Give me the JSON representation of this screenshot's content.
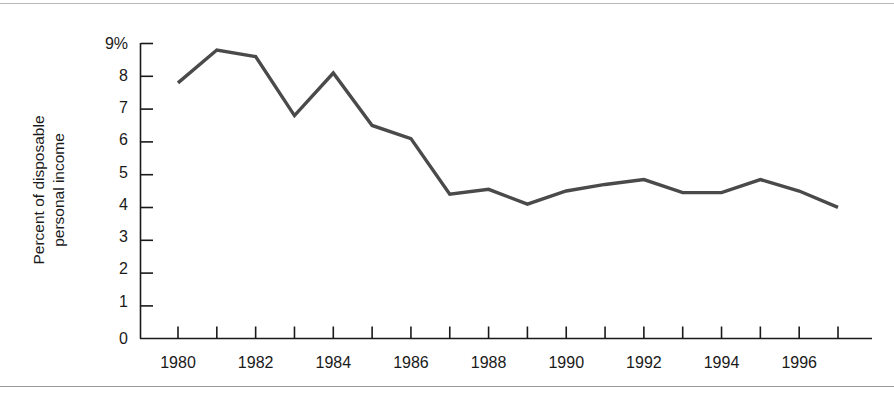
{
  "chart_data": {
    "type": "line",
    "title": "",
    "subtitle": "",
    "xlabel": "",
    "ylabel": "Percent of disposable personal income",
    "ylabel_lines": [
      "Percent of disposable",
      "personal income"
    ],
    "x": [
      1980,
      1981,
      1982,
      1983,
      1984,
      1985,
      1986,
      1987,
      1988,
      1989,
      1990,
      1991,
      1992,
      1993,
      1994,
      1995,
      1996,
      1997
    ],
    "values": [
      7.8,
      8.8,
      8.6,
      6.8,
      8.1,
      6.5,
      6.1,
      4.4,
      4.55,
      4.1,
      4.5,
      4.7,
      4.85,
      4.45,
      4.45,
      4.85,
      4.5,
      4.0
    ],
    "series": [
      {
        "name": "Personal saving rate",
        "values": [
          7.8,
          8.8,
          8.6,
          6.8,
          8.1,
          6.5,
          6.1,
          4.4,
          4.55,
          4.1,
          4.5,
          4.7,
          4.85,
          4.45,
          4.45,
          4.85,
          4.5,
          4.0
        ]
      }
    ],
    "xlim": [
      1980,
      1997
    ],
    "ylim": [
      0,
      9
    ],
    "ytick_values": [
      0,
      1,
      2,
      3,
      4,
      5,
      6,
      7,
      8,
      9
    ],
    "ytick_labels": [
      "0",
      "1",
      "2",
      "3",
      "4",
      "5",
      "6",
      "7",
      "8",
      "9%"
    ],
    "xtick_values": [
      1980,
      1981,
      1982,
      1983,
      1984,
      1985,
      1986,
      1987,
      1988,
      1989,
      1990,
      1991,
      1992,
      1993,
      1994,
      1995,
      1996,
      1997
    ],
    "xtick_labels_shown": [
      "1980",
      "1982",
      "1984",
      "1986",
      "1988",
      "1990",
      "1992",
      "1994",
      "1996"
    ],
    "xtick_labeled_values": [
      1980,
      1982,
      1984,
      1986,
      1988,
      1990,
      1992,
      1994,
      1996
    ],
    "grid": false,
    "legend": false,
    "legend_position": "none",
    "line_color": "#4a4a4a",
    "axis_color": "#1a1a1a",
    "background_color": "#ffffff",
    "line_width": 3.4
  },
  "frame": {
    "top_rule_color": "#b8b8b8",
    "bottom_rule_color": "#9a9a9a"
  }
}
